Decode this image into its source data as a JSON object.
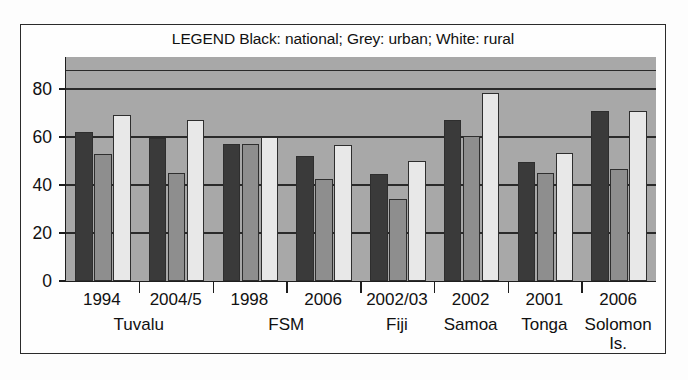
{
  "chart_data": {
    "type": "bar",
    "title": "",
    "legend_text": "LEGEND Black: national; Grey: urban; White: rural",
    "legend_position": "top-center",
    "xlabel": "",
    "ylabel": "",
    "ylim": [
      0,
      93
    ],
    "yticks": [
      0,
      20,
      40,
      60,
      80
    ],
    "ytick_labels": [
      "0",
      "20",
      "40",
      "60",
      "80"
    ],
    "grid": true,
    "categories": [
      "1994",
      "2004/5",
      "1998",
      "2006",
      "2002/03",
      "2002",
      "2001",
      "2006"
    ],
    "groups": [
      {
        "country": "Tuvalu",
        "years": [
          "1994",
          "2004/5"
        ]
      },
      {
        "country": "FSM",
        "years": [
          "1998",
          "2006"
        ]
      },
      {
        "country": "Fiji",
        "years": [
          "2002/03"
        ]
      },
      {
        "country": "Samoa",
        "years": [
          "2002"
        ]
      },
      {
        "country": "Tonga",
        "years": [
          "2001"
        ]
      },
      {
        "country": "Solomon Is.",
        "years": [
          "2006"
        ]
      }
    ],
    "series": [
      {
        "name": "national",
        "color": "#3a3a3a",
        "values": [
          62,
          59.5,
          57,
          52,
          44.5,
          67,
          49.5,
          71
        ]
      },
      {
        "name": "urban",
        "color": "#8e8e8e",
        "values": [
          53,
          45,
          57,
          42.5,
          34,
          60.5,
          45,
          46.5
        ]
      },
      {
        "name": "rural",
        "color": "#e8e8e8",
        "values": [
          69,
          67,
          60,
          56.5,
          50,
          78.5,
          53.5,
          71
        ]
      }
    ]
  },
  "axis": {
    "y_tick_labels": [
      "80",
      "60",
      "40",
      "20",
      "0"
    ]
  },
  "xaxis": {
    "year_labels": [
      "1994",
      "2004/5",
      "1998",
      "2006",
      "2002/03",
      "2002",
      "2001",
      "2006"
    ],
    "country_labels": [
      "Tuvalu",
      "FSM",
      "Fiji",
      "Samoa",
      "Tonga",
      "Solomon",
      "Is."
    ]
  }
}
